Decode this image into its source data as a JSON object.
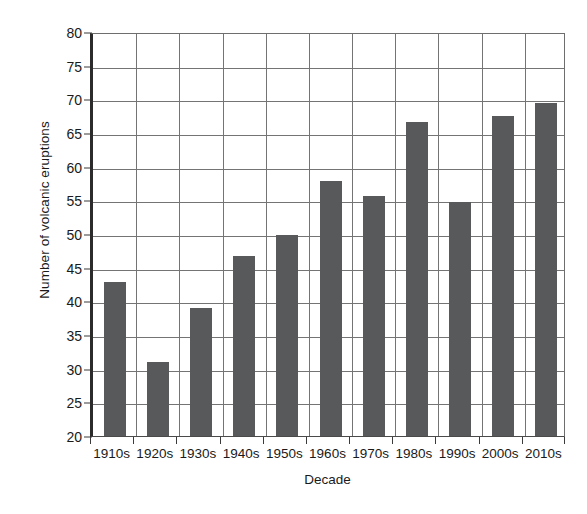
{
  "chart_data": {
    "type": "bar",
    "title": "",
    "subtitle": "",
    "xlabel": "Decade",
    "ylabel": "Number of volcanic eruptions",
    "categories": [
      "1910s",
      "1920s",
      "1930s",
      "1940s",
      "1950s",
      "1960s",
      "1970s",
      "1980s",
      "1990s",
      "2000s",
      "2010s"
    ],
    "values": [
      42.9,
      31.0,
      39.0,
      46.8,
      49.9,
      57.8,
      55.7,
      66.6,
      54.7,
      67.6,
      69.5
    ],
    "ylim": [
      20,
      80
    ],
    "ytick_step": 5,
    "yticks": [
      80,
      75,
      70,
      65,
      60,
      55,
      50,
      45,
      40,
      35,
      30,
      25,
      20
    ],
    "ytick_labels": [
      "80",
      "75",
      "70",
      "65",
      "60",
      "55",
      "50",
      "45",
      "40",
      "35",
      "30",
      "25",
      "20"
    ],
    "grid": "both",
    "legend": "none",
    "bar_color": "#58595b",
    "grid_color": "#747474",
    "axis_color": "#2b2b2b",
    "background_color": "#ffffff",
    "annotations": []
  }
}
